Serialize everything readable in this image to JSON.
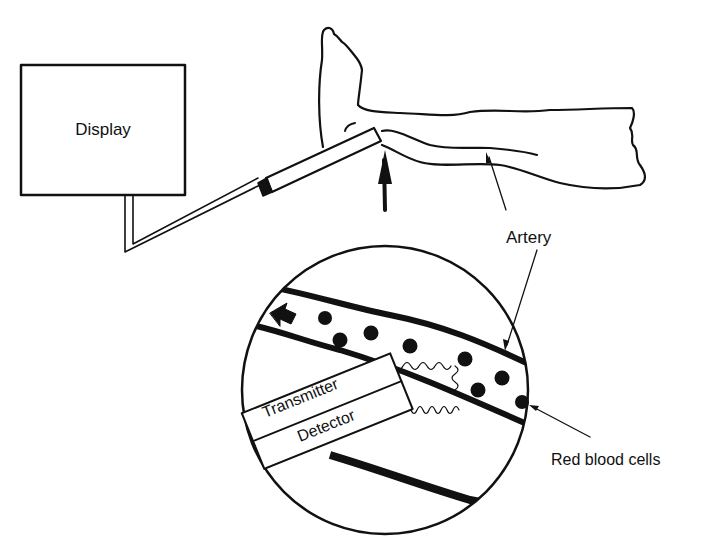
{
  "diagram": {
    "labels": {
      "display": "Display",
      "artery_top": "Artery",
      "transmitter": "Transmitter",
      "detector": "Detector",
      "red_blood_cells": "Red blood cells"
    },
    "components": [
      "display-box",
      "cable",
      "probe",
      "leg-with-foot",
      "artery",
      "magnified-view",
      "blood-flow-arrow",
      "ultrasound-waves"
    ],
    "colors": {
      "ink": "#111111",
      "background": "#ffffff"
    }
  }
}
